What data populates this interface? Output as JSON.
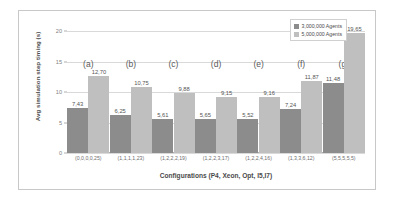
{
  "chart_data": {
    "type": "bar",
    "title": "",
    "xlabel": "Configurations (P4, Xeon, Opt, I5,I7)",
    "ylabel": "Avg simulation step timing (s)",
    "ylim": [
      0,
      20
    ],
    "yticks": [
      "0",
      "5",
      "10",
      "15",
      "20"
    ],
    "grid": true,
    "legend_position": "top-right",
    "categories": [
      "(0,0,0,0,25)",
      "(1,1,1,1,23)",
      "(1,2,2,2,19)",
      "(1,2,2,3,17)",
      "(1,2,2,4,16)",
      "(1,3,3,6,12)",
      "(5,5,5,5,5)"
    ],
    "group_letters": [
      "(a)",
      "(b)",
      "(c)",
      "(d)",
      "(e)",
      "(f)",
      "(g)"
    ],
    "series": [
      {
        "name": "3,000,000 Agents",
        "color": "#8c8c8c",
        "values": [
          7.43,
          6.25,
          5.61,
          5.65,
          5.52,
          7.24,
          11.48
        ],
        "labels": [
          "7,43",
          "6,25",
          "5,61",
          "5,65",
          "5,52",
          "7,24",
          "11,48"
        ]
      },
      {
        "name": "5,000,000 Agents",
        "color": "#bfbfbf",
        "values": [
          12.7,
          10.75,
          9.88,
          9.15,
          9.16,
          11.87,
          19.65
        ],
        "labels": [
          "12,70",
          "10,75",
          "9,88",
          "9,15",
          "9,16",
          "11,87",
          "19,65"
        ]
      }
    ]
  }
}
